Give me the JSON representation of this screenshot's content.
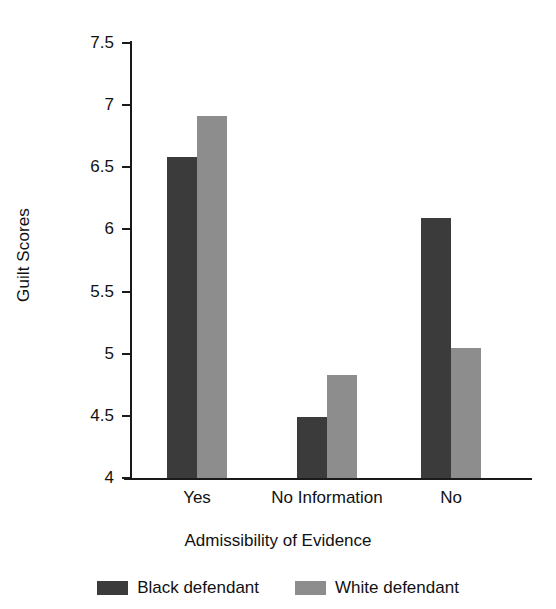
{
  "chart_data": {
    "type": "bar",
    "title": "",
    "subtitle": "",
    "xlabel": "Admissibility of Evidence",
    "ylabel": "Guilt Scores",
    "categories": [
      "Yes",
      "No Information",
      "No"
    ],
    "series": [
      {
        "name": "Black defendant",
        "color": "#3b3b3b",
        "values": [
          6.58,
          4.49,
          6.09
        ]
      },
      {
        "name": "White defendant",
        "color": "#8d8d8d",
        "values": [
          6.91,
          4.83,
          5.05
        ]
      }
    ],
    "ylim": [
      4,
      7.5
    ],
    "ytick_labels": [
      "7.5",
      "7",
      "6.5",
      "6",
      "5.5",
      "5",
      "4.5",
      "4"
    ],
    "ytick_values": [
      7.5,
      7,
      6.5,
      6,
      5.5,
      5,
      4.5,
      4
    ],
    "grid": false,
    "legend_position": "bottom",
    "bar_style": "grouped",
    "axis_color": "#1a1a1a",
    "background_color": "#ffffff"
  },
  "legend": {
    "items": [
      {
        "label": "Black defendant",
        "swatch": "dark-swatch-icon"
      },
      {
        "label": "White defendant",
        "swatch": "light-swatch-icon"
      }
    ]
  }
}
